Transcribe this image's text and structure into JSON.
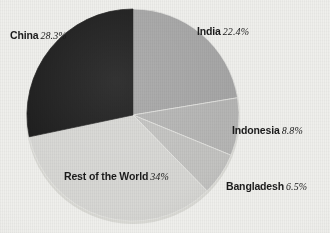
{
  "figure": {
    "kind": "pie-chart",
    "background_color": "#efefec"
  },
  "chart_data": {
    "type": "pie",
    "title": "",
    "xlabel": "",
    "ylabel": "",
    "legend_position": "none",
    "grid": false,
    "units": "percent",
    "start_angle_deg": 0,
    "direction": "clockwise",
    "categories": [
      "India",
      "Indonesia",
      "Bangladesh",
      "Rest of the World",
      "China"
    ],
    "values": [
      22.4,
      8.8,
      6.5,
      34,
      28.3
    ],
    "slices": [
      {
        "label": "India",
        "value": 22.4,
        "value_text": "22.4%",
        "color": "#a6a6a6",
        "label_position": "outside-top-right"
      },
      {
        "label": "Indonesia",
        "value": 8.8,
        "value_text": "8.8%",
        "color": "#b5b5b4",
        "label_position": "outside-right"
      },
      {
        "label": "Bangladesh",
        "value": 6.5,
        "value_text": "6.5%",
        "color": "#c3c3c1",
        "label_position": "outside-bottom-right"
      },
      {
        "label": "Rest of the World",
        "value": 34,
        "value_text": "34%",
        "color": "#d7d7d4",
        "label_position": "inside-bottom-left"
      },
      {
        "label": "China",
        "value": 28.3,
        "value_text": "28.3%",
        "color": "#1d1d1d",
        "label_position": "outside-top-left"
      }
    ]
  }
}
